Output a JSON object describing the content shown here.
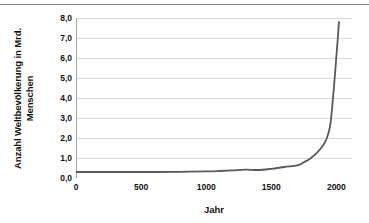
{
  "chart_data": {
    "type": "line",
    "title": "",
    "xlabel": "Jahr",
    "ylabel": "Anzahl Weltbevölkerung in Mrd. Menschen",
    "xlim": [
      0,
      2120
    ],
    "ylim": [
      0,
      8
    ],
    "grid": true,
    "legend": null,
    "x_ticks": [
      "0",
      "500",
      "1000",
      "1500",
      "2000"
    ],
    "x_tick_values": [
      0,
      500,
      1000,
      1500,
      2000
    ],
    "y_ticks": [
      "0,0",
      "1,0",
      "2,0",
      "3,0",
      "4,0",
      "5,0",
      "6,0",
      "7,0",
      "8,0"
    ],
    "y_tick_values": [
      0,
      1,
      2,
      3,
      4,
      5,
      6,
      7,
      8
    ],
    "series": [
      {
        "name": "Weltbevölkerung",
        "color": "#595959",
        "x": [
          0,
          200,
          400,
          600,
          800,
          1000,
          1100,
          1200,
          1300,
          1400,
          1500,
          1600,
          1700,
          1750,
          1800,
          1850,
          1900,
          1927,
          1950,
          1960,
          1974,
          1987,
          1999,
          2011,
          2020
        ],
        "values": [
          0.3,
          0.3,
          0.3,
          0.3,
          0.31,
          0.33,
          0.35,
          0.38,
          0.42,
          0.4,
          0.46,
          0.55,
          0.63,
          0.79,
          0.98,
          1.26,
          1.65,
          2.0,
          2.54,
          3.03,
          4.0,
          5.0,
          6.0,
          7.0,
          7.8
        ]
      }
    ]
  },
  "axes": {
    "y_title": "Anzahl Weltbevölkerung in Mrd. Menschen",
    "x_title": "Jahr"
  },
  "colors": {
    "line": "#595959",
    "gridline": "#d9d9d9",
    "axis": "#a6a6a6",
    "text": "#111111",
    "top_rule": "#8c8c8c",
    "background": "#ffffff"
  }
}
